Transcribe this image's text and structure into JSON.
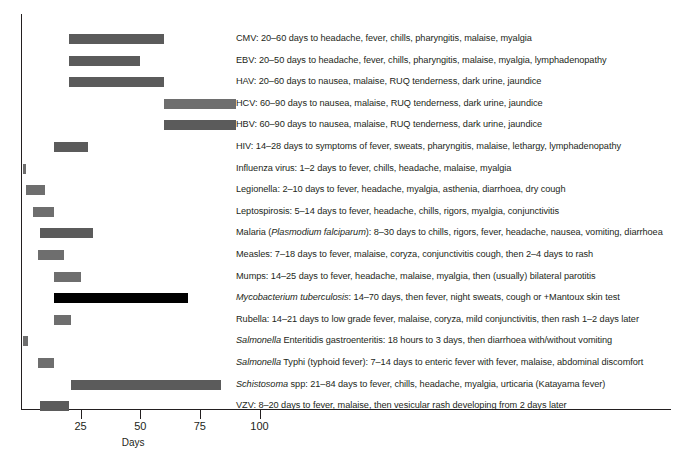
{
  "chart_data": {
    "type": "bar",
    "orientation": "horizontal",
    "subtype": "range-bars",
    "title": "",
    "xlabel": "Days",
    "ylabel": "",
    "xlim": [
      0,
      110
    ],
    "ylim": [
      0,
      18
    ],
    "grid": false,
    "legend": "none",
    "xticks": [
      25,
      50,
      75,
      100
    ],
    "xticklabels": [
      "25",
      "50",
      "75",
      "100"
    ],
    "colors": {
      "bar_default": "#5b5b5b",
      "bar_highlight": "#000000",
      "axis": "#231f20",
      "text": "#231f20",
      "background": "#ffffff"
    },
    "categories": [
      "CMV",
      "EBV",
      "HAV",
      "HCV",
      "HBV",
      "HIV",
      "Influenza virus",
      "Legionella",
      "Leptospirosis",
      "Malaria (Plasmodium falciparum)",
      "Measles",
      "Mumps",
      "Mycobacterium tuberculosis",
      "Rubella",
      "Salmonella Enteritidis gastroenteritis",
      "Salmonella Typhi (typhoid fever)",
      "Schistosoma spp",
      "VZV"
    ],
    "series": [
      {
        "name": "incubation start (days)",
        "values": [
          20,
          20,
          20,
          60,
          60,
          14,
          1,
          2,
          5,
          8,
          7,
          14,
          14,
          14,
          0.75,
          7,
          21,
          8
        ]
      },
      {
        "name": "incubation end (days)",
        "values": [
          60,
          50,
          60,
          90,
          90,
          28,
          2,
          10,
          14,
          30,
          18,
          25,
          70,
          21,
          3,
          14,
          84,
          20
        ]
      }
    ],
    "bars": [
      {
        "label_plain": "CMV: 20–60 days to headache, fever, chills, pharyngitis, malaise, myalgia",
        "label_html": "CMV: 20–60 days to headache, fever, chills, pharyngitis, malaise, myalgia",
        "start": 20,
        "end": 60,
        "color": "#5b5b5b"
      },
      {
        "label_plain": "EBV: 20–50 days to headache, fever, chills, pharyngitis, malaise, myalgia, lymphadenopathy",
        "label_html": "EBV: 20–50 days to headache, fever, chills, pharyngitis, malaise, myalgia, lymphadenopathy",
        "start": 20,
        "end": 50,
        "color": "#5b5b5b"
      },
      {
        "label_plain": "HAV: 20–60 days to nausea, malaise, RUQ tenderness, dark urine, jaundice",
        "label_html": "HAV: 20–60 days to nausea, malaise, RUQ tenderness, dark urine, jaundice",
        "start": 20,
        "end": 60,
        "color": "#5b5b5b"
      },
      {
        "label_plain": "HCV: 60–90 days to nausea, malaise, RUQ tenderness, dark urine, jaundice",
        "label_html": "HCV: 60–90 days to nausea, malaise, RUQ tenderness, dark urine, jaundice",
        "start": 60,
        "end": 90,
        "color": "#6e6e6e"
      },
      {
        "label_plain": "HBV: 60–90 days to nausea, malaise, RUQ tenderness, dark urine, jaundice",
        "label_html": "HBV: 60–90 days to nausea, malaise, RUQ tenderness, dark urine, jaundice",
        "start": 60,
        "end": 90,
        "color": "#5b5b5b"
      },
      {
        "label_plain": "HIV: 14–28 days to symptoms of fever, sweats, pharyngitis, malaise, lethargy, lymphadenopathy",
        "label_html": "HIV: 14–28 days to symptoms of fever, sweats, pharyngitis, malaise, lethargy, lymphadenopathy",
        "start": 14,
        "end": 28,
        "color": "#5b5b5b"
      },
      {
        "label_plain": "Influenza virus: 1–2 days to fever, chills, headache, malaise, myalgia",
        "label_html": "Influenza virus: 1–2 days to fever, chills, headache, malaise, myalgia",
        "start": 1,
        "end": 2,
        "color": "#6e6e6e"
      },
      {
        "label_plain": "Legionella: 2–10 days to fever, headache, myalgia, asthenia, diarrhoea, dry cough",
        "label_html": "Legionella: 2–10 days to fever, headache, myalgia, asthenia, diarrhoea, dry cough",
        "start": 2,
        "end": 10,
        "color": "#6e6e6e"
      },
      {
        "label_plain": "Leptospirosis: 5–14 days to fever, headache, chills, rigors, myalgia, conjunctivitis",
        "label_html": "Leptospirosis: 5–14 days to fever, headache, chills, rigors, myalgia, conjunctivitis",
        "start": 5,
        "end": 14,
        "color": "#6e6e6e"
      },
      {
        "label_plain": "Malaria (Plasmodium falciparum): 8–30 days to chills, rigors, fever, headache, nausea, vomiting, diarrhoea",
        "label_html": "Malaria (<i>Plasmodium falciparum</i>): 8–30 days to chills, rigors, fever, headache, nausea, vomiting, diarrhoea",
        "start": 8,
        "end": 30,
        "color": "#5b5b5b"
      },
      {
        "label_plain": "Measles: 7–18 days to fever, malaise, coryza, conjunctivitis cough, then 2–4 days to rash",
        "label_html": "Measles: 7–18 days to fever, malaise, coryza, conjunctivitis cough, then 2–4 days to rash",
        "start": 7,
        "end": 18,
        "color": "#6e6e6e"
      },
      {
        "label_plain": "Mumps: 14–25 days to fever, headache, malaise, myalgia, then (usually) bilateral parotitis",
        "label_html": "Mumps: 14–25 days to fever, headache, malaise, myalgia, then (usually) bilateral parotitis",
        "start": 14,
        "end": 25,
        "color": "#6e6e6e"
      },
      {
        "label_plain": "Mycobacterium tuberculosis: 14–70 days, then fever, night sweats, cough or +Mantoux skin test",
        "label_html": "<i>Mycobacterium tuberculosis</i>: 14–70 days, then fever, night sweats, cough or +Mantoux skin test",
        "start": 14,
        "end": 70,
        "color": "#000000"
      },
      {
        "label_plain": "Rubella: 14–21 days to low grade fever, malaise, coryza, mild conjunctivitis, then rash 1–2 days later",
        "label_html": "Rubella: 14–21 days to low grade fever, malaise, coryza, mild conjunctivitis, then rash 1–2 days later",
        "start": 14,
        "end": 21,
        "color": "#6e6e6e"
      },
      {
        "label_plain": "Salmonella Enteritidis gastroenteritis: 18 hours to 3 days, then diarrhoea with/without vomiting",
        "label_html": "<i>Salmonella</i> Enteritidis gastroenteritis: 18 hours to 3 days, then diarrhoea with/without vomiting",
        "start": 0.75,
        "end": 3,
        "color": "#6e6e6e"
      },
      {
        "label_plain": "Salmonella Typhi (typhoid fever): 7–14 days to enteric fever with fever, malaise, abdominal discomfort",
        "label_html": "<i>Salmonella</i> Typhi (typhoid fever): 7–14 days to enteric fever with fever, malaise, abdominal discomfort",
        "start": 7,
        "end": 14,
        "color": "#6e6e6e"
      },
      {
        "label_plain": "Schistosoma spp: 21–84 days to fever, chills, headache, myalgia, urticaria (Katayama fever)",
        "label_html": "<i>Schistosoma</i> spp: 21–84 days to fever, chills, headache, myalgia, urticaria (Katayama fever)",
        "start": 21,
        "end": 84,
        "color": "#5b5b5b"
      },
      {
        "label_plain": "VZV: 8–20 days to fever, malaise, then vesicular rash developing from 2 days later",
        "label_html": "VZV: 8–20 days to fever, malaise, then vesicular rash developing from 2 days later",
        "start": 8,
        "end": 20,
        "color": "#5b5b5b"
      }
    ]
  }
}
